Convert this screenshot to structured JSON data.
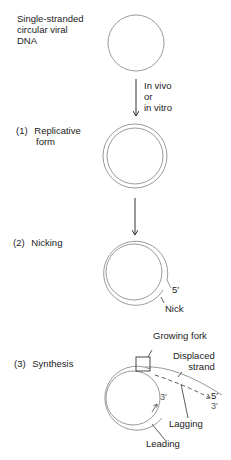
{
  "start_label": [
    "Single-stranded",
    "circular viral",
    "DNA"
  ],
  "conversion_label": [
    "In vivo",
    "or",
    "in vitro"
  ],
  "steps": [
    {
      "number": "(1)",
      "label": [
        "Replicative",
        "form"
      ]
    },
    {
      "number": "(2)",
      "label": [
        "Nicking"
      ]
    },
    {
      "number": "(3)",
      "label": [
        "Synthesis"
      ]
    }
  ],
  "nicking_labels": {
    "end": "5′",
    "nick": "Nick"
  },
  "synthesis_labels": {
    "growing_fork": "Growing fork",
    "displaced_strand": [
      "Displaced",
      "strand"
    ],
    "five_prime": "5′",
    "three_prime_lagging": "3′",
    "three_prime_leading": "3′",
    "lagging": "Lagging",
    "leading": "Leading"
  },
  "colors": {
    "strand": "#9a9a9a",
    "text": "#222222",
    "arrow": "#333333"
  }
}
